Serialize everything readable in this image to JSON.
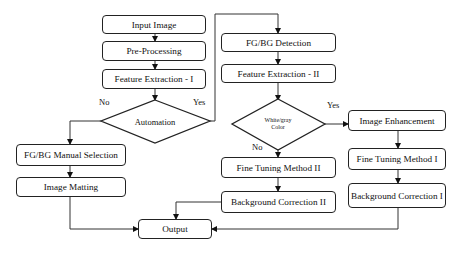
{
  "diagram": {
    "type": "flowchart",
    "nodes": {
      "input_image": "Input Image",
      "pre_processing": "Pre-Processing",
      "feature_extraction_1": "Feature Extraction - I",
      "automation": "Automation",
      "fgbg_manual_selection": "FG/BG Manual Selection",
      "image_matting": "Image Matting",
      "fgbg_detection": "FG/BG Detection",
      "feature_extraction_2": "Feature Extraction - II",
      "white_gray_color": "White/gray Color",
      "image_enhancement": "Image Enhancement",
      "fine_tuning_1": "Fine Tuning Method I",
      "background_correction_1": "Background Correction I",
      "fine_tuning_2": "Fine Tuning Method II",
      "background_correction_2": "Background Correction II",
      "output": "Output"
    },
    "edge_labels": {
      "automation_no": "No",
      "automation_yes": "Yes",
      "color_yes": "Yes",
      "color_no": "No"
    },
    "edges": [
      [
        "Input Image",
        "Pre-Processing"
      ],
      [
        "Pre-Processing",
        "Feature Extraction - I"
      ],
      [
        "Feature Extraction - I",
        "Automation"
      ],
      [
        "Automation",
        "FG/BG Manual Selection",
        "No"
      ],
      [
        "Automation",
        "FG/BG Detection",
        "Yes"
      ],
      [
        "FG/BG Manual Selection",
        "Image Matting"
      ],
      [
        "Image Matting",
        "Output"
      ],
      [
        "FG/BG Detection",
        "Feature Extraction - II"
      ],
      [
        "Feature Extraction - II",
        "White/gray Color"
      ],
      [
        "White/gray Color",
        "Image Enhancement",
        "Yes"
      ],
      [
        "White/gray Color",
        "Fine Tuning Method II",
        "No"
      ],
      [
        "Image Enhancement",
        "Fine Tuning Method I"
      ],
      [
        "Fine Tuning Method I",
        "Background Correction I"
      ],
      [
        "Background Correction I",
        "Output"
      ],
      [
        "Fine Tuning Method II",
        "Background Correction II"
      ],
      [
        "Background Correction II",
        "Output"
      ]
    ]
  }
}
